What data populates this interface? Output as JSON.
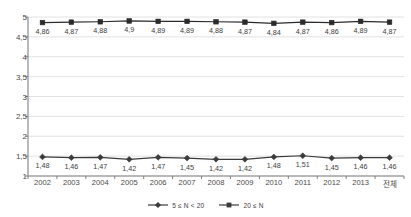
{
  "chart_data": {
    "type": "line",
    "title": "",
    "subtitle": "",
    "xlabel": "",
    "ylabel": "",
    "categories": [
      "2002",
      "2003",
      "2004",
      "2005",
      "2006",
      "2007",
      "2008",
      "2009",
      "2010",
      "2011",
      "2012",
      "2013",
      "전체"
    ],
    "ylim": [
      1,
      5
    ],
    "yticks": [
      1,
      1.5,
      2,
      2.5,
      3,
      3.5,
      4,
      4.5,
      5
    ],
    "ytick_labels": [
      "1",
      "1,5",
      "2",
      "2,5",
      "3",
      "3,5",
      "4",
      "4,5",
      "5"
    ],
    "grid": true,
    "grid_axis": "y",
    "legend_position": "bottom-center",
    "decimal_separator": ",",
    "series": [
      {
        "name": "5 ≤ N < 20",
        "marker": "diamond",
        "color": "#3b3b3b",
        "values": [
          1.48,
          1.46,
          1.47,
          1.42,
          1.47,
          1.45,
          1.42,
          1.42,
          1.48,
          1.51,
          1.45,
          1.46,
          1.46
        ],
        "labels": [
          "1,48",
          "1,46",
          "1,47",
          "1,42",
          "1,47",
          "1,45",
          "1,42",
          "1,42",
          "1,48",
          "1,51",
          "1,45",
          "1,46",
          "1,46"
        ]
      },
      {
        "name": "20 ≤ N",
        "marker": "square",
        "color": "#2b2b2b",
        "values": [
          4.86,
          4.87,
          4.88,
          4.9,
          4.89,
          4.89,
          4.88,
          4.87,
          4.84,
          4.87,
          4.86,
          4.89,
          4.87
        ],
        "labels": [
          "4,86",
          "4,87",
          "4,88",
          "4,9",
          "4,89",
          "4,89",
          "4,88",
          "4,87",
          "4,84",
          "4,87",
          "4,86",
          "4,89",
          "4,87"
        ]
      }
    ]
  },
  "legend": {
    "items": [
      {
        "label": "5 ≤ N < 20",
        "marker": "diamond"
      },
      {
        "label": "20 ≤ N",
        "marker": "square"
      }
    ]
  },
  "colors": {
    "axis": "#808080",
    "grid": "#e2e2e2",
    "series_line": "#3b3b3b",
    "text": "#4a4a4a",
    "background": "#ffffff"
  }
}
